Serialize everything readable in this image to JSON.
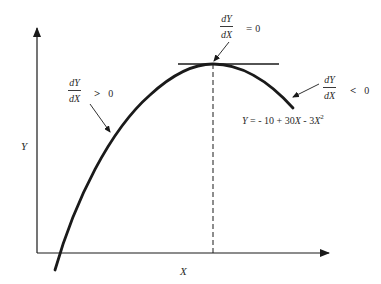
{
  "diagram": {
    "axes": {
      "y_label": "Y",
      "x_label": "X"
    },
    "curve": {
      "equation_lhs": "Y",
      "equation_eq": "=",
      "equation_c0": "- 10",
      "equation_plus": "+",
      "equation_c1": "30",
      "equation_x1": "X",
      "equation_minus": "-",
      "equation_c2": "3",
      "equation_x2": "X",
      "equation_exp": "2",
      "equation_full": "Y = - 10 + 30X - 3X²"
    },
    "annotations": {
      "increasing": {
        "numerator": "dY",
        "denominator": "dX",
        "operator": ">",
        "value": "0"
      },
      "maximum": {
        "numerator": "dY",
        "denominator": "dX",
        "operator": "=",
        "value": "0"
      },
      "decreasing": {
        "numerator": "dY",
        "denominator": "dX",
        "operator": "<",
        "value": "0"
      }
    },
    "colors": {
      "ink": "#1a1a1a",
      "background": "#ffffff"
    }
  }
}
